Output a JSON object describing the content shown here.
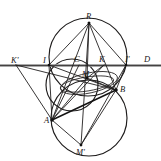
{
  "figure": {
    "background_color": "#ffffff",
    "stroke_color": "#1e1c1c",
    "axis_color": "#8d8d8d"
  },
  "labels": [
    {
      "id": "R",
      "text": "R",
      "x": 86,
      "y": 12
    },
    {
      "id": "Kp",
      "text": "K'",
      "x": 11,
      "y": 56
    },
    {
      "id": "I",
      "text": "I",
      "x": 43,
      "y": 56
    },
    {
      "id": "C",
      "text": "C",
      "x": 74,
      "y": 55
    },
    {
      "id": "K",
      "text": "K",
      "x": 99,
      "y": 55
    },
    {
      "id": "Ip",
      "text": "I'",
      "x": 125,
      "y": 55
    },
    {
      "id": "D",
      "text": "D",
      "x": 144,
      "y": 55
    },
    {
      "id": "M",
      "text": "M",
      "x": 82,
      "y": 70
    },
    {
      "id": "B",
      "text": "B",
      "x": 120,
      "y": 85
    },
    {
      "id": "A",
      "text": "A",
      "x": 44,
      "y": 116
    },
    {
      "id": "Mp",
      "text": "M'",
      "x": 76,
      "y": 148
    }
  ],
  "points": [
    {
      "id": "R",
      "x": 89,
      "y": 23
    },
    {
      "id": "Kp",
      "x": 16,
      "y": 65
    },
    {
      "id": "I",
      "x": 49,
      "y": 65
    },
    {
      "id": "C",
      "x": 79,
      "y": 65
    },
    {
      "id": "K",
      "x": 104,
      "y": 65
    },
    {
      "id": "Ip",
      "x": 126,
      "y": 65
    },
    {
      "id": "D",
      "x": 151,
      "y": 65
    },
    {
      "id": "M",
      "x": 87,
      "y": 78
    },
    {
      "id": "B",
      "x": 116,
      "y": 90
    },
    {
      "id": "A",
      "x": 52,
      "y": 120
    },
    {
      "id": "Mp",
      "x": 81,
      "y": 145
    }
  ],
  "circles": [
    {
      "id": "upper-circle",
      "cx": 88,
      "cy": 57,
      "r": 39
    },
    {
      "id": "lower-circle",
      "cx": 89,
      "cy": 118,
      "r": 38
    },
    {
      "id": "left-circle",
      "cx": 72,
      "cy": 85,
      "r": 26
    }
  ],
  "ellipses": [
    {
      "id": "central-lens-ellipse",
      "cx": 89,
      "cy": 83,
      "rx": 29,
      "ry": 10,
      "rotation": -12
    }
  ],
  "segments": [
    {
      "id": "transversal-line",
      "from": "far-left",
      "to": "far-right",
      "x1": 0,
      "y1": 65.5,
      "x2": 161,
      "y2": 65.5
    },
    {
      "id": "R-to-I",
      "x1": 89,
      "y1": 23,
      "x2": 49,
      "y2": 65
    },
    {
      "id": "R-to-Ip",
      "x1": 89,
      "y1": 23,
      "x2": 126,
      "y2": 65
    },
    {
      "id": "R-to-A",
      "x1": 89,
      "y1": 23,
      "x2": 52,
      "y2": 120
    },
    {
      "id": "R-to-Mp",
      "x1": 89,
      "y1": 23,
      "x2": 81,
      "y2": 145
    },
    {
      "id": "R-to-M",
      "x1": 89,
      "y1": 23,
      "x2": 87,
      "y2": 78
    },
    {
      "id": "R-to-B",
      "x1": 89,
      "y1": 23,
      "x2": 116,
      "y2": 90
    },
    {
      "id": "Kp-to-A",
      "x1": 16,
      "y1": 65,
      "x2": 52,
      "y2": 120
    },
    {
      "id": "Kp-to-B",
      "x1": 16,
      "y1": 65,
      "x2": 116,
      "y2": 90
    },
    {
      "id": "I-to-B",
      "x1": 49,
      "y1": 65,
      "x2": 116,
      "y2": 90
    },
    {
      "id": "I-to-A",
      "x1": 49,
      "y1": 65,
      "x2": 52,
      "y2": 120
    },
    {
      "id": "A-to-B",
      "x1": 52,
      "y1": 120,
      "x2": 116,
      "y2": 90
    },
    {
      "id": "A-to-M",
      "x1": 52,
      "y1": 120,
      "x2": 87,
      "y2": 78
    },
    {
      "id": "A-to-K",
      "x1": 52,
      "y1": 120,
      "x2": 104,
      "y2": 65
    },
    {
      "id": "A-to-C",
      "x1": 52,
      "y1": 120,
      "x2": 79,
      "y2": 65
    },
    {
      "id": "A-to-Mp",
      "x1": 52,
      "y1": 120,
      "x2": 81,
      "y2": 145
    },
    {
      "id": "B-to-Mp",
      "x1": 116,
      "y1": 90,
      "x2": 81,
      "y2": 145
    },
    {
      "id": "B-to-M",
      "x1": 116,
      "y1": 90,
      "x2": 87,
      "y2": 78
    },
    {
      "id": "M-to-K",
      "x1": 87,
      "y1": 78,
      "x2": 104,
      "y2": 65
    },
    {
      "id": "Ip-to-B",
      "x1": 126,
      "y1": 65,
      "x2": 116,
      "y2": 90
    },
    {
      "id": "Ip-to-Mp",
      "x1": 126,
      "y1": 65,
      "x2": 81,
      "y2": 145
    }
  ]
}
